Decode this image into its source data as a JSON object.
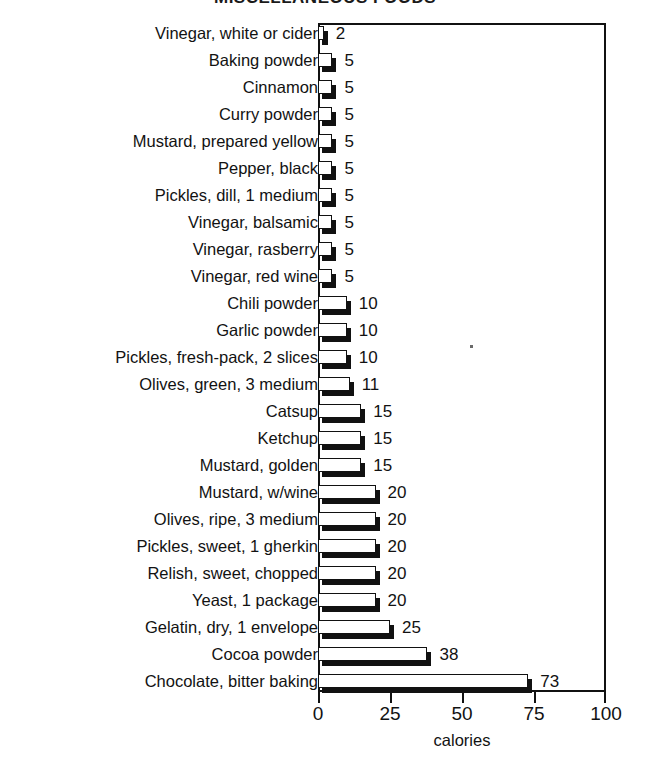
{
  "chart_data": {
    "type": "bar",
    "orientation": "horizontal",
    "title": "MISCELLANEOUS FOODS",
    "xlabel": "calories",
    "ylabel": "",
    "xlim": [
      0,
      100
    ],
    "xticks": [
      0,
      25,
      50,
      75,
      100
    ],
    "xtick_labels": [
      "0",
      "25",
      "50",
      "75",
      "100"
    ],
    "grid": false,
    "legend": null,
    "categories": [
      "Vinegar, white or cider",
      "Baking powder",
      "Cinnamon",
      "Curry powder",
      "Mustard, prepared yellow",
      "Pepper, black",
      "Pickles, dill, 1 medium",
      "Vinegar, balsamic",
      "Vinegar, rasberry",
      "Vinegar, red wine",
      "Chili powder",
      "Garlic powder",
      "Pickles, fresh-pack, 2 slices",
      "Olives, green, 3 medium",
      "Catsup",
      "Ketchup",
      "Mustard, golden",
      "Mustard, w/wine",
      "Olives, ripe, 3 medium",
      "Pickles, sweet, 1 gherkin",
      "Relish, sweet, chopped",
      "Yeast, 1 package",
      "Gelatin, dry, 1 envelope",
      "Cocoa powder",
      "Chocolate, bitter baking"
    ],
    "values": [
      2,
      5,
      5,
      5,
      5,
      5,
      5,
      5,
      5,
      5,
      10,
      10,
      10,
      11,
      15,
      15,
      15,
      20,
      20,
      20,
      20,
      20,
      25,
      38,
      73
    ],
    "value_labels": [
      "2",
      "5",
      "5",
      "5",
      "5",
      "5",
      "5",
      "5",
      "5",
      "5",
      "10",
      "10",
      "10",
      "11",
      "15",
      "15",
      "15",
      "20",
      "20",
      "20",
      "20",
      "20",
      "25",
      "38",
      "73"
    ]
  },
  "style": {
    "bar_face_color": "#ffffff",
    "bar_edge_color": "#111111",
    "bar_shadow_color": "#111111",
    "axis_color": "#111111",
    "text_color": "#121212",
    "background": "#ffffff"
  }
}
